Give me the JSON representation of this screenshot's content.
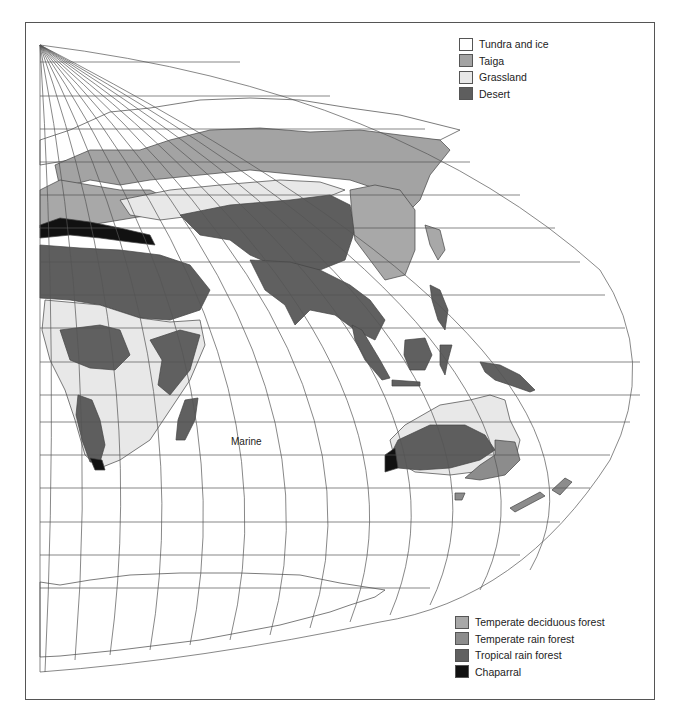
{
  "map": {
    "title": "",
    "projection": "interrupted sinusoidal (Eastern Hemisphere)",
    "ocean_label": "Marine",
    "legend_top": [
      {
        "label": "Tundra and ice",
        "color": "#ffffff"
      },
      {
        "label": "Taiga",
        "color": "#a3a3a3"
      },
      {
        "label": "Grassland",
        "color": "#e8e8e8"
      },
      {
        "label": "Desert",
        "color": "#5e5e5e"
      }
    ],
    "legend_bottom": [
      {
        "label": "Temperate deciduous forest",
        "color": "#a8a8a8"
      },
      {
        "label": "Temperate rain forest",
        "color": "#8c8c8c"
      },
      {
        "label": "Tropical rain forest",
        "color": "#606060"
      },
      {
        "label": "Chaparral",
        "color": "#111111"
      }
    ],
    "colors": {
      "grid": "#555555",
      "outline": "#444444",
      "frame": "#555555"
    }
  }
}
